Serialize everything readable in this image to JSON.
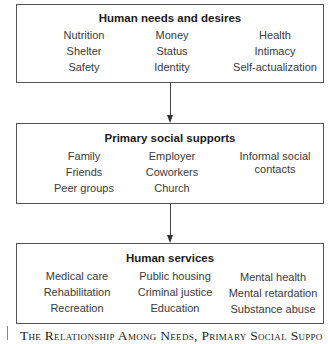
{
  "diagram": {
    "boxes": [
      {
        "title": "Human needs and desires",
        "columns": [
          [
            "Nutrition",
            "Shelter",
            "Safety"
          ],
          [
            "Money",
            "Status",
            "Identity"
          ],
          [
            "Health",
            "Intimacy",
            "Self-actualization"
          ]
        ]
      },
      {
        "title": "Primary social supports",
        "columns": [
          [
            "Family",
            "Friends",
            "Peer groups"
          ],
          [
            "Employer",
            "Coworkers",
            "Church"
          ],
          [
            "Informal social",
            "contacts"
          ]
        ]
      },
      {
        "title": "Human services",
        "columns": [
          [
            "Medical care",
            "Rehabilitation",
            "Recreation"
          ],
          [
            "Public housing",
            "Criminal justice",
            "Education"
          ],
          [
            "Mental health",
            "Mental retardation",
            "Substance abuse"
          ]
        ]
      }
    ],
    "arrows": [
      {
        "from": "Human needs and desires",
        "to": "Primary social supports"
      },
      {
        "from": "Primary social supports",
        "to": "Human services"
      }
    ],
    "caption": "The Relationship Among Needs, Primary Social Suppo"
  }
}
